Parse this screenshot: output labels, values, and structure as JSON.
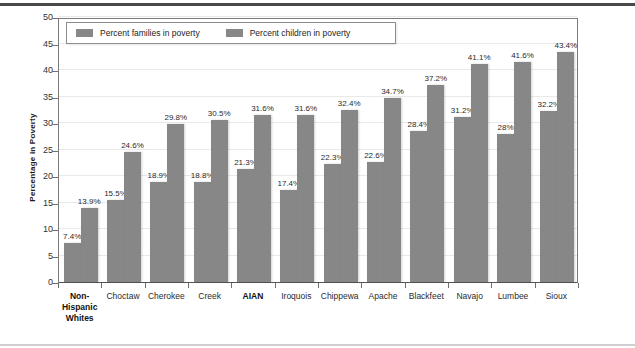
{
  "chart_data": {
    "type": "bar",
    "title": "",
    "subtitle": "",
    "xlabel": "",
    "ylabel": "Percentage in Poverty",
    "ylim": [
      0,
      50
    ],
    "yticks": [
      0,
      5,
      10,
      15,
      20,
      25,
      30,
      35,
      40,
      45,
      50
    ],
    "grid": true,
    "legend_position": "top-left-inside",
    "bar_color": "#878787",
    "categories": [
      "Non-Hispanic Whites",
      "Choctaw",
      "Cherokee",
      "Creek",
      "AIAN",
      "Iroquois",
      "Chippewa",
      "Apache",
      "Blackfeet",
      "Navajo",
      "Lumbee",
      "Sioux"
    ],
    "category_display": [
      [
        "Non-",
        "Hispanic",
        "Whites"
      ],
      [
        "Choctaw"
      ],
      [
        "Cherokee"
      ],
      [
        "Creek"
      ],
      [
        "AIAN"
      ],
      [
        "Iroquois"
      ],
      [
        "Chippewa"
      ],
      [
        "Apache"
      ],
      [
        "Blackfeet"
      ],
      [
        "Navajo"
      ],
      [
        "Lumbee"
      ],
      [
        "Sioux"
      ]
    ],
    "bold_categories": [
      "Non-Hispanic Whites",
      "AIAN"
    ],
    "series": [
      {
        "name": "Percent families in poverty",
        "values": [
          7.4,
          15.5,
          18.9,
          18.8,
          21.3,
          17.4,
          22.3,
          22.6,
          28.4,
          31.2,
          28.0,
          32.2
        ],
        "labels": [
          "7.4%",
          "15.5%",
          "18.9%",
          "18.8%",
          "21.3%",
          "17.4%",
          "22.3%",
          "22.6%",
          "28.4%",
          "31.2%",
          "28%",
          "32.2%"
        ]
      },
      {
        "name": "Percent children in poverty",
        "values": [
          13.9,
          24.6,
          29.8,
          30.5,
          31.6,
          31.6,
          32.4,
          34.7,
          37.2,
          41.1,
          41.6,
          43.4
        ],
        "labels": [
          "13.9%",
          "24.6%",
          "29.8%",
          "30.5%",
          "31.6%",
          "31.6%",
          "32.4%",
          "34.7%",
          "37.2%",
          "41.1%",
          "41.6%",
          "43.4%"
        ]
      }
    ]
  },
  "legend": {
    "entries": [
      {
        "label": "Percent families in poverty"
      },
      {
        "label": "Percent children in poverty"
      }
    ]
  }
}
